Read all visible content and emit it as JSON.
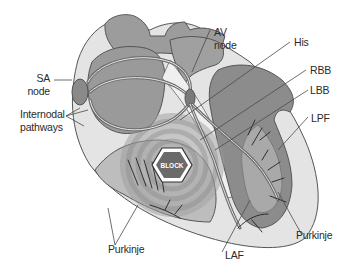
{
  "diagram": {
    "block_badge": "BLOCK",
    "labels": {
      "sa_node": [
        "SA",
        "node"
      ],
      "internodal_pathways": [
        "Internodal",
        "pathways"
      ],
      "av_node": [
        "AV",
        "node"
      ],
      "his": "His",
      "rbb": "RBB",
      "lbb": "LBB",
      "lpf": "LPF",
      "purkinje_left": "Purkinje",
      "laf": "LAF",
      "purkinje_right": "Purkinje"
    },
    "colors": {
      "outline": "#555555",
      "tissue_light": "#d9d9d9",
      "tissue_mid": "#a8a8a8",
      "tissue_dark": "#8c8c8c",
      "pathway": "#6e6e6e",
      "label_text": "#2a2a2a",
      "leader_line": "#4a4a4a"
    }
  }
}
